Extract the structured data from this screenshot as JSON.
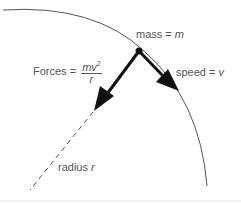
{
  "diagram": {
    "labels": {
      "mass": {
        "text": "mass = ",
        "var": "m"
      },
      "speed": {
        "text": "speed = ",
        "var": "v"
      },
      "forces": {
        "text": "Forces = ",
        "numerator": "mv",
        "exponent": "2",
        "denominator": "r"
      },
      "radius": {
        "text": "radius ",
        "var": "r"
      }
    },
    "colors": {
      "arc": "#555555",
      "arrow": "#111111",
      "text": "#555555",
      "dashed": "#555555",
      "baseline": "#e6e6e6"
    },
    "elements": [
      "circular-arc",
      "mass-point",
      "force-arrow",
      "velocity-arrow",
      "radius-dashed-line"
    ]
  }
}
